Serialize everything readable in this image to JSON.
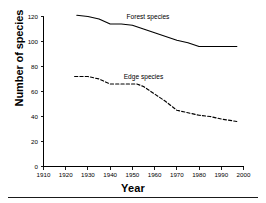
{
  "chart_data": {
    "type": "line",
    "title": "",
    "xlabel": "Year",
    "ylabel": "Number of species",
    "xlim": [
      1910,
      2000
    ],
    "ylim": [
      0,
      120
    ],
    "xticks": [
      1910,
      1920,
      1930,
      1940,
      1950,
      1960,
      1970,
      1980,
      1990,
      2000
    ],
    "xtick_labels": [
      "1910",
      "1920",
      "1930",
      "1940",
      "1950",
      "1960",
      "1970",
      "1980",
      "1990",
      "2000"
    ],
    "yticks": [
      0,
      20,
      40,
      60,
      80,
      100,
      120
    ],
    "ytick_labels": [
      "0",
      "20",
      "40",
      "60",
      "80",
      "100",
      "120"
    ],
    "grid": false,
    "legend": "inline-labels",
    "series": [
      {
        "name": "Forest species",
        "style": "solid",
        "color": "#000000",
        "label_x": 1957,
        "label_y": 118,
        "x": [
          1925,
          1930,
          1935,
          1940,
          1945,
          1950,
          1955,
          1960,
          1965,
          1970,
          1975,
          1980,
          1985,
          1990,
          1997
        ],
        "values": [
          121,
          120,
          118,
          114,
          114,
          113,
          110,
          107,
          104,
          101,
          99,
          96,
          96,
          96,
          96
        ]
      },
      {
        "name": "Edge species",
        "style": "dashed",
        "color": "#000000",
        "label_x": 1955,
        "label_y": 70,
        "x": [
          1924,
          1930,
          1935,
          1940,
          1945,
          1950,
          1952,
          1955,
          1960,
          1965,
          1970,
          1975,
          1980,
          1985,
          1990,
          1997
        ],
        "values": [
          72,
          72,
          70,
          66,
          66,
          66,
          66,
          64,
          58,
          52,
          45,
          43,
          41,
          40,
          38,
          36
        ]
      }
    ]
  },
  "axis_titles": {
    "x": "Year",
    "y": "Number of species"
  }
}
